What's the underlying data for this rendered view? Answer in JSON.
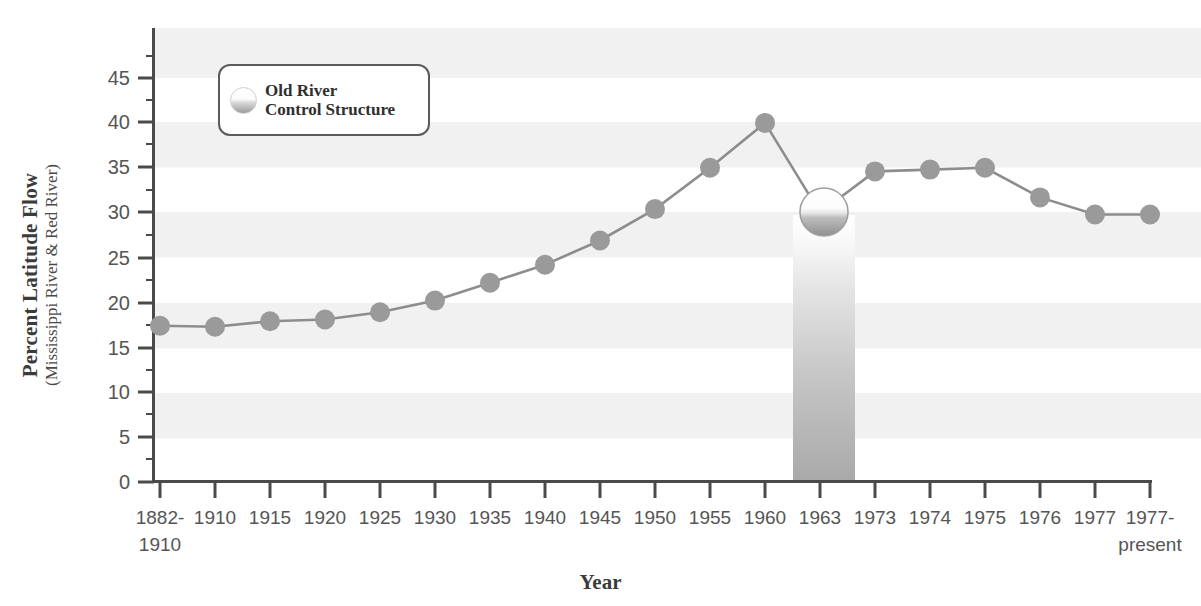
{
  "chart_data": {
    "type": "line",
    "title": "",
    "xlabel": "Year",
    "ylabel": "Percent Latitude Flow",
    "ylabel_sub": "(Mississippi River & Red River)",
    "ylim": [
      0,
      50
    ],
    "yticks": [
      0,
      5,
      10,
      15,
      20,
      25,
      30,
      35,
      40,
      45
    ],
    "ytick_labels": [
      "0",
      "5",
      "10",
      "15",
      "20",
      "25",
      "30",
      "35",
      "40",
      "45"
    ],
    "grid": "alternating horizontal bands every 10 units",
    "legend_position": "upper left inside plot",
    "categories": [
      "1882-\n1910",
      "1910",
      "1915",
      "1920",
      "1925",
      "1930",
      "1935",
      "1940",
      "1945",
      "1950",
      "1955",
      "1960",
      "1963",
      "1973",
      "1974",
      "1975",
      "1976",
      "1977",
      "1977-\npresent"
    ],
    "category_labels_multiline": [
      [
        "1882-",
        "1910"
      ],
      [
        "1910",
        ""
      ],
      [
        "1915",
        ""
      ],
      [
        "1920",
        ""
      ],
      [
        "1925",
        ""
      ],
      [
        "1930",
        ""
      ],
      [
        "1935",
        ""
      ],
      [
        "1940",
        ""
      ],
      [
        "1945",
        ""
      ],
      [
        "1950",
        ""
      ],
      [
        "1955",
        ""
      ],
      [
        "1960",
        ""
      ],
      [
        "1963",
        ""
      ],
      [
        "1973",
        ""
      ],
      [
        "1974",
        ""
      ],
      [
        "1975",
        ""
      ],
      [
        "1976",
        ""
      ],
      [
        "1977",
        ""
      ],
      [
        "1977-",
        "present"
      ]
    ],
    "values": [
      17.4,
      17.3,
      17.9,
      18.1,
      18.9,
      20.2,
      22.2,
      24.2,
      26.9,
      30.4,
      35.0,
      40.0,
      30.0,
      34.6,
      34.8,
      35.0,
      31.7,
      29.8,
      29.8
    ],
    "series": [
      {
        "name": "Percent Latitude Flow",
        "values": [
          17.4,
          17.3,
          17.9,
          18.1,
          18.9,
          20.2,
          22.2,
          24.2,
          26.9,
          30.4,
          35.0,
          40.0,
          30.0,
          34.6,
          34.8,
          35.0,
          31.7,
          29.8,
          29.8
        ]
      }
    ],
    "annotations": [
      {
        "name": "old-river-control-structure",
        "category": "1963",
        "value": 30.0,
        "marker": "large sphere",
        "vertical_band": true,
        "band_note": "gradient gray column from marker down to x axis"
      }
    ]
  },
  "legend": {
    "swatch_icon": "sphere-icon",
    "line1": "Old River",
    "line2": "Control Structure"
  },
  "colors": {
    "marker": "#9a9a9a",
    "line": "#8d8d8d",
    "axis": "#4a4a4a",
    "band": "#f1f1f1",
    "text": "#555555",
    "title": "#3b3b3b",
    "legend_border": "#5b5b5b",
    "event_band_top": "#fdfdfd",
    "event_band_bottom": "#a8a8a8"
  }
}
